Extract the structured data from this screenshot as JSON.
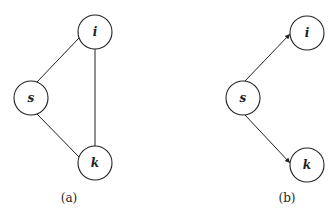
{
  "diagrams": [
    {
      "caption": "(a)",
      "nodes": [
        {
          "id": "i",
          "label": "i"
        },
        {
          "id": "s",
          "label": "s"
        },
        {
          "id": "k",
          "label": "k"
        }
      ],
      "edges": [
        {
          "from": "s",
          "to": "i",
          "directed": false
        },
        {
          "from": "s",
          "to": "k",
          "directed": false
        },
        {
          "from": "i",
          "to": "k",
          "directed": false
        }
      ]
    },
    {
      "caption": "(b)",
      "nodes": [
        {
          "id": "i",
          "label": "i"
        },
        {
          "id": "s",
          "label": "s"
        },
        {
          "id": "k",
          "label": "k"
        }
      ],
      "edges": [
        {
          "from": "s",
          "to": "i",
          "directed": true
        },
        {
          "from": "s",
          "to": "k",
          "directed": true
        }
      ]
    }
  ]
}
